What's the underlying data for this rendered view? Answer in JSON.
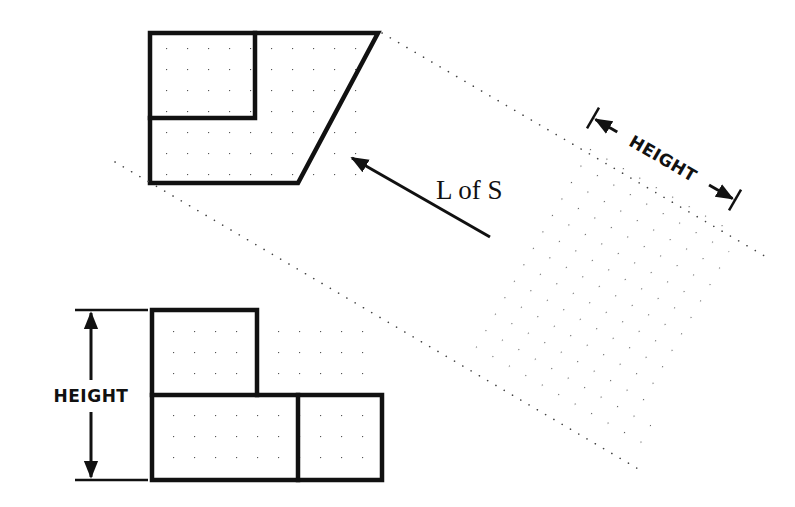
{
  "diagram": {
    "type": "orthographic-projection-auxiliary-view",
    "labels": {
      "line_of_sight": "L of S",
      "height_primary": "HEIGHT",
      "height_auxiliary": "HEIGHT"
    },
    "colors": {
      "line": "#111111",
      "projection_dots": "#555555",
      "background": "#ffffff"
    },
    "views": [
      {
        "name": "top-view",
        "shape": "trapezoid-with-inner-rectangle"
      },
      {
        "name": "front-view",
        "shape": "stepped-rectangles"
      },
      {
        "name": "auxiliary-view",
        "shape": "dotted-projection-field"
      }
    ]
  }
}
